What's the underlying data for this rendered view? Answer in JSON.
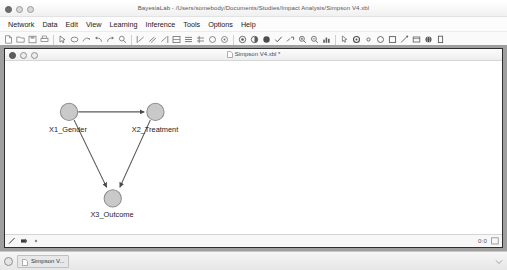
{
  "app": {
    "title": "BayesiaLab - /Users/somebody/Documents/Studies/Impact Analysis/Simpson V4.xbl",
    "window_controls": [
      {
        "name": "close-button",
        "label": "Close"
      },
      {
        "name": "minimize-button",
        "label": "Minimize"
      },
      {
        "name": "maximize-button",
        "label": "Maximize"
      }
    ]
  },
  "menubar": {
    "items": [
      {
        "label": "Network"
      },
      {
        "label": "Data"
      },
      {
        "label": "Edit"
      },
      {
        "label": "View"
      },
      {
        "label": "Learning"
      },
      {
        "label": "Inference"
      },
      {
        "label": "Tools"
      },
      {
        "label": "Options"
      },
      {
        "label": "Help"
      }
    ]
  },
  "toolbar": {
    "groups": [
      {
        "buttons": [
          {
            "icon": "new-document-icon",
            "tooltip": "New"
          },
          {
            "icon": "open-folder-icon",
            "tooltip": "Open"
          },
          {
            "icon": "save-disk-icon",
            "tooltip": "Save"
          },
          {
            "icon": "print-icon",
            "tooltip": "Print"
          }
        ]
      },
      {
        "buttons": [
          {
            "icon": "select-arrow-icon",
            "tooltip": "Select"
          },
          {
            "icon": "node-ellipse-icon",
            "tooltip": "Add Node"
          },
          {
            "icon": "arc-arrow-icon",
            "tooltip": "Add Arc"
          },
          {
            "icon": "undo-icon",
            "tooltip": "Undo"
          },
          {
            "icon": "redo-icon",
            "tooltip": "Redo"
          },
          {
            "icon": "search-icon",
            "tooltip": "Find"
          }
        ]
      },
      {
        "buttons": [
          {
            "icon": "align-left-icon",
            "tooltip": "Align Left"
          },
          {
            "icon": "align-center-icon",
            "tooltip": "Align Center"
          },
          {
            "icon": "align-right-icon",
            "tooltip": "Align Right"
          },
          {
            "icon": "distribute-horizontal-icon",
            "tooltip": "Distribute Horizontally"
          },
          {
            "icon": "distribute-vertical-icon",
            "tooltip": "Distribute Vertically"
          },
          {
            "icon": "grid-layout-icon",
            "tooltip": "Grid Layout"
          },
          {
            "icon": "circle-layout-icon",
            "tooltip": "Circle Layout"
          },
          {
            "icon": "radial-layout-icon",
            "tooltip": "Radial Layout"
          }
        ]
      },
      {
        "buttons": [
          {
            "icon": "target-icon",
            "tooltip": "Set Target Node"
          },
          {
            "icon": "monitor-icon",
            "tooltip": "Show Monitors"
          },
          {
            "icon": "filled-circle-icon",
            "tooltip": "Node Comment"
          },
          {
            "icon": "validate-check-icon",
            "tooltip": "Validate"
          },
          {
            "icon": "link-icon",
            "tooltip": "Link"
          },
          {
            "icon": "magnify-plus-icon",
            "tooltip": "Zoom In"
          },
          {
            "icon": "magnify-minus-icon",
            "tooltip": "Zoom Out"
          },
          {
            "icon": "chart-bars-icon",
            "tooltip": "Charts"
          }
        ]
      },
      {
        "buttons": [
          {
            "icon": "cursor-pointer-icon",
            "tooltip": "Pointer Mode"
          },
          {
            "icon": "gear-icon",
            "tooltip": "Settings"
          },
          {
            "icon": "small-circle-icon",
            "tooltip": "Node"
          },
          {
            "icon": "open-circle-icon",
            "tooltip": "Ellipse Node"
          },
          {
            "icon": "square-node-icon",
            "tooltip": "Rectangle Node"
          },
          {
            "icon": "edge-tool-icon",
            "tooltip": "Edge Tool"
          },
          {
            "icon": "table-icon",
            "tooltip": "Table View"
          },
          {
            "icon": "globe-icon",
            "tooltip": "Network View"
          },
          {
            "icon": "panel-icon",
            "tooltip": "Panel"
          }
        ]
      }
    ]
  },
  "document_window": {
    "title": "Simpson V4.xbl *",
    "icon": "document-icon",
    "controls": [
      {
        "name": "doc-close-button",
        "label": "Close"
      },
      {
        "name": "doc-minimize-button",
        "label": "Minimize"
      },
      {
        "name": "doc-maximize-button",
        "label": "Maximize"
      }
    ]
  },
  "graph": {
    "node_fill": "#c9c9c9",
    "node_stroke": "#8c8c8c",
    "edge_color": "#5a5a5a",
    "nodes": [
      {
        "id": "X1",
        "label": "X1_Gender",
        "cx": 63,
        "cy": 50,
        "r": 8.5,
        "label_x": 63,
        "label_y": 64
      },
      {
        "id": "X2",
        "label": "X2_Treatment",
        "cx": 148,
        "cy": 50,
        "r": 8.5,
        "label_x": 150,
        "label_y": 64
      },
      {
        "id": "X3",
        "label": "X3_Outcome",
        "cx": 106,
        "cy": 135,
        "r": 8.5,
        "label_x": 107,
        "label_y": 149
      }
    ],
    "edges": [
      {
        "from": "X1",
        "to": "X2",
        "directed": true
      },
      {
        "from": "X1",
        "to": "X3",
        "directed": true
      },
      {
        "from": "X2",
        "to": "X3",
        "directed": true
      }
    ]
  },
  "status_bar": {
    "left_icons": [
      {
        "icon": "arc-tool-icon",
        "tooltip": "Arc Tool"
      },
      {
        "icon": "node-tool-icon",
        "tooltip": "Node Tool"
      },
      {
        "icon": "info-dot-icon",
        "tooltip": "Info"
      }
    ],
    "coordinates": "0:0",
    "right_icon": "resize-grip-icon"
  },
  "taskbar": {
    "start_button": "start-icon",
    "tasks": [
      {
        "label": "Simpson V...",
        "icon": "document-icon"
      }
    ],
    "tray_icon": "tray-icon"
  }
}
